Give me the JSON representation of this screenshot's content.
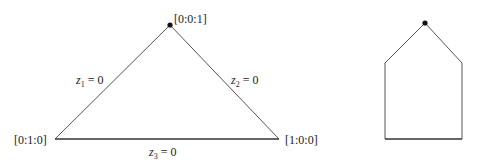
{
  "diagram": {
    "triangle": {
      "vertices": {
        "top": {
          "label": "[0:0:1]",
          "x": 170,
          "y": 25,
          "marked": true
        },
        "left": {
          "label": "[0:1:0]",
          "x": 55,
          "y": 139,
          "marked": false
        },
        "right": {
          "label": "[1:0:0]",
          "x": 279,
          "y": 139,
          "marked": false
        }
      },
      "edges": {
        "left": {
          "var": "z",
          "sub": "1",
          "eq": " = 0"
        },
        "right": {
          "var": "z",
          "sub": "2",
          "eq": " = 0"
        },
        "bottom": {
          "var": "z",
          "sub": "3",
          "eq": " = 0"
        }
      }
    },
    "pentagon": {
      "apex": {
        "x": 425,
        "y": 23,
        "marked": true
      },
      "shoulder_left": {
        "x": 385,
        "y": 63
      },
      "shoulder_right": {
        "x": 462,
        "y": 63
      },
      "bottom_left": {
        "x": 385,
        "y": 139
      },
      "bottom_right": {
        "x": 462,
        "y": 139
      }
    },
    "colors": {
      "stroke": "#555555",
      "stroke_bottom": "#333333",
      "dot": "#111111",
      "text": "#222222"
    }
  }
}
